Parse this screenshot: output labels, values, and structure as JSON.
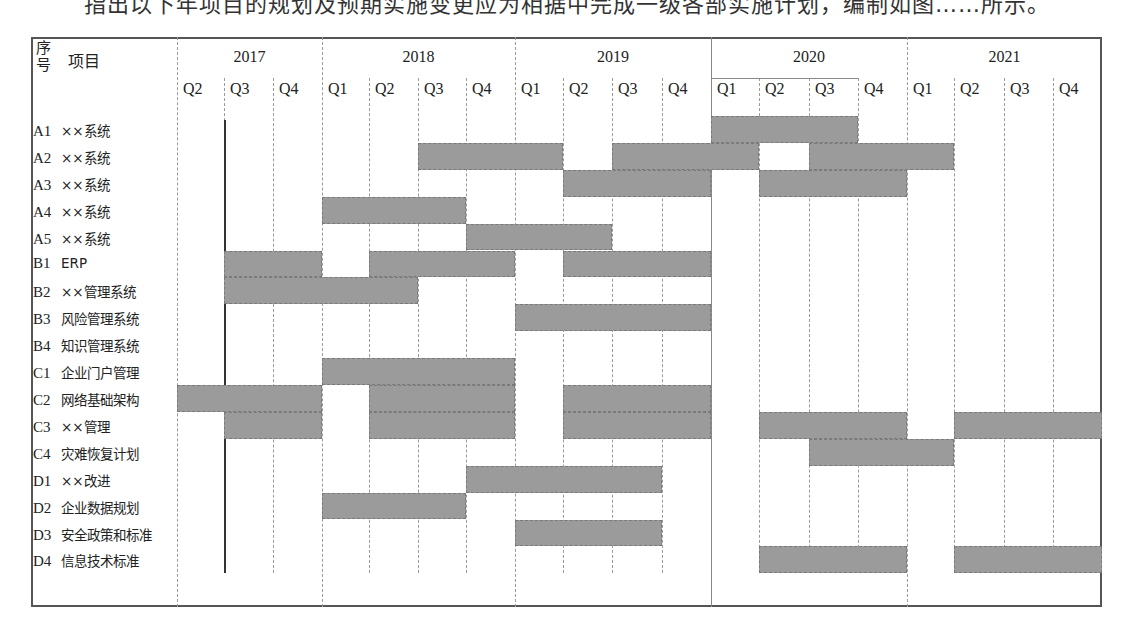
{
  "document": {
    "top_text_fragment": "指出以下年项目的规划及预期实施变更应为相据中完成一级各部实施计划，编制如图……所示。"
  },
  "chart_data": {
    "type": "gantt",
    "title": "",
    "header": {
      "seq_label": "序号",
      "item_label": "项目"
    },
    "years": [
      {
        "label": "2017",
        "quarters": [
          "Q2",
          "Q3",
          "Q4"
        ]
      },
      {
        "label": "2018",
        "quarters": [
          "Q1",
          "Q2",
          "Q3",
          "Q4"
        ]
      },
      {
        "label": "2019",
        "quarters": [
          "Q1",
          "Q2",
          "Q3",
          "Q4"
        ]
      },
      {
        "label": "2020",
        "quarters": [
          "Q1",
          "Q2",
          "Q3",
          "Q4"
        ]
      },
      {
        "label": "2021",
        "quarters": [
          "Q1",
          "Q2",
          "Q3",
          "Q4"
        ]
      }
    ],
    "columns": [
      "2017Q2",
      "2017Q3",
      "2017Q4",
      "2018Q1",
      "2018Q2",
      "2018Q3",
      "2018Q4",
      "2019Q1",
      "2019Q2",
      "2019Q3",
      "2019Q4",
      "2020Q1",
      "2020Q2",
      "2020Q3",
      "2020Q4",
      "2021Q1",
      "2021Q2",
      "2021Q3",
      "2021Q4"
    ],
    "rows": [
      {
        "code": "A1",
        "name": "××系统",
        "spans": [
          [
            "2020Q1",
            "2020Q3"
          ]
        ]
      },
      {
        "code": "A2",
        "name": "××系统",
        "spans": [
          [
            "2018Q3",
            "2019Q1"
          ],
          [
            "2019Q3",
            "2020Q1"
          ],
          [
            "2020Q3",
            "2021Q1"
          ]
        ]
      },
      {
        "code": "A3",
        "name": "××系统",
        "spans": [
          [
            "2019Q2",
            "2019Q4"
          ],
          [
            "2020Q2",
            "2020Q4"
          ]
        ]
      },
      {
        "code": "A4",
        "name": "××系统",
        "spans": [
          [
            "2018Q1",
            "2018Q3"
          ]
        ]
      },
      {
        "code": "A5",
        "name": "××系统",
        "spans": [
          [
            "2018Q4",
            "2019Q2"
          ]
        ]
      },
      {
        "code": "B1",
        "name": "ERP",
        "spans": [
          [
            "2017Q3",
            "2017Q4"
          ],
          [
            "2018Q2",
            "2018Q4"
          ],
          [
            "2019Q2",
            "2019Q4"
          ]
        ]
      },
      {
        "code": "B2",
        "name": "××管理系统",
        "spans": [
          [
            "2017Q3",
            "2018Q2"
          ]
        ]
      },
      {
        "code": "B3",
        "name": "风险管理系统",
        "spans": [
          [
            "2019Q1",
            "2019Q4"
          ]
        ]
      },
      {
        "code": "B4",
        "name": "知识管理系统",
        "spans": []
      },
      {
        "code": "C1",
        "name": "企业门户管理",
        "spans": [
          [
            "2018Q1",
            "2018Q4"
          ]
        ]
      },
      {
        "code": "C2",
        "name": "网络基础架构",
        "spans": [
          [
            "2017Q2",
            "2017Q4"
          ],
          [
            "2018Q2",
            "2018Q4"
          ],
          [
            "2019Q2",
            "2019Q4"
          ]
        ]
      },
      {
        "code": "C3",
        "name": "××管理",
        "spans": [
          [
            "2017Q3",
            "2017Q4"
          ],
          [
            "2018Q2",
            "2018Q4"
          ],
          [
            "2019Q2",
            "2019Q4"
          ],
          [
            "2020Q2",
            "2020Q4"
          ],
          [
            "2021Q2",
            "2021Q4"
          ]
        ]
      },
      {
        "code": "C4",
        "name": "灾难恢复计划",
        "spans": [
          [
            "2020Q3",
            "2021Q1"
          ]
        ]
      },
      {
        "code": "D1",
        "name": "××改进",
        "spans": [
          [
            "2018Q4",
            "2019Q3"
          ]
        ]
      },
      {
        "code": "D2",
        "name": "企业数据规划",
        "spans": [
          [
            "2018Q1",
            "2018Q3"
          ]
        ]
      },
      {
        "code": "D3",
        "name": "安全政策和标准",
        "spans": [
          [
            "2019Q1",
            "2019Q3"
          ]
        ]
      },
      {
        "code": "D4",
        "name": "信息技术标准",
        "spans": [
          [
            "2020Q2",
            "2020Q4"
          ],
          [
            "2021Q2",
            "2021Q4"
          ]
        ]
      }
    ],
    "bar_color": "#9b9b9b",
    "grid": true,
    "legend": null
  }
}
